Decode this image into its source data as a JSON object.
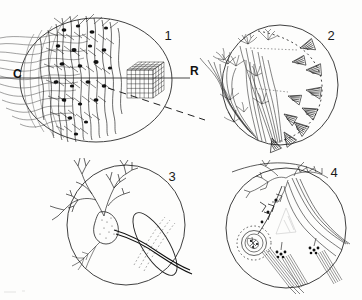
{
  "figure": {
    "background_color": "#fdfdfc",
    "ink_color": "#1a1a1a",
    "width": 362,
    "height": 300
  },
  "axis_labels": {
    "caudal": "C",
    "rostral": "R"
  },
  "panels": [
    {
      "number": "1",
      "name": "dense-neuropil-panel",
      "description": "Dense plexus of stained neurons with afferent fibers entering from the left and a reconstructed grid lattice block at right",
      "number_x": 168,
      "number_y": 40,
      "circle_cx": 96,
      "circle_cy": 80,
      "circle_rx": 76,
      "circle_ry": 62
    },
    {
      "number": "2",
      "name": "tufted-dendrite-panel",
      "description": "Neurons with tufted terminal arbors on the left and cone-shaped terminal endings fanning to the right, bounded by a dashed arc",
      "number_x": 331,
      "number_y": 40,
      "circle_cx": 280,
      "circle_cy": 85,
      "circle_rx": 58,
      "circle_ry": 60
    },
    {
      "number": "3",
      "name": "disc-terminal-panel",
      "description": "Branching dendritic tree with a large elliptical disc-shaped terminal field and efferent axon",
      "number_x": 172,
      "number_y": 181,
      "circle_cx": 126,
      "circle_cy": 225,
      "circle_rx": 59,
      "circle_ry": 60
    },
    {
      "number": "4",
      "name": "glomerulus-panel",
      "description": "Neuron with axon bundles and a dotted glomerular terminal region at lower left",
      "number_x": 334,
      "number_y": 177,
      "circle_cx": 286,
      "circle_cy": 228,
      "circle_rx": 60,
      "circle_ry": 60
    }
  ],
  "annotations": {
    "horizontal_axis_line": "solid horizontal reference line running from left margin through panel 1 to the R label",
    "dashed_axis_line": "dashed diagonal reference line descending to the right toward panel 2",
    "grid_block_label": "reconstructed cubic lattice grid",
    "dashed_arc_label": "dashed boundary arc in panel 2",
    "dotted_glomerulus_label": "dotted glomerular boundary in panel 4"
  }
}
